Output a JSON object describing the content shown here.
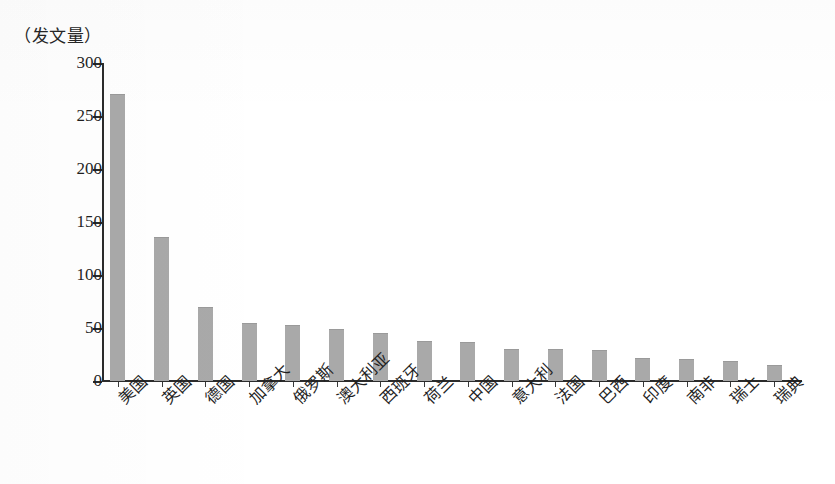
{
  "chart_data": {
    "type": "bar",
    "title": "",
    "axis_unit_caption": "（发文量）",
    "xlabel": "",
    "ylabel": "发文量",
    "ylim": [
      0,
      300
    ],
    "ytick_step": 50,
    "grid": false,
    "legend": "none",
    "bar_color": "#a9a9a9",
    "axis_color": "#2b2b2b",
    "categories": [
      "美国",
      "英国",
      "德国",
      "加拿大",
      "俄罗斯",
      "澳大利亚",
      "西班牙",
      "荷兰",
      "中国",
      "意大利",
      "法国",
      "巴西",
      "印度",
      "南非",
      "瑞士",
      "瑞典"
    ],
    "values": [
      270,
      135,
      69,
      54,
      52,
      48,
      44,
      37,
      36,
      29,
      29,
      28,
      21,
      20,
      18,
      14
    ],
    "ytick_labels": [
      "0",
      "50",
      "100",
      "150",
      "200",
      "250",
      "300"
    ],
    "ytick_values": [
      0,
      50,
      100,
      150,
      200,
      250,
      300
    ]
  }
}
